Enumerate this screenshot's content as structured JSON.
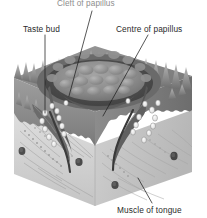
{
  "figure": {
    "type": "anatomical-cutaway-diagram",
    "palette": {
      "background": "#ffffff",
      "label_text": "#2b2b2b",
      "faded_label_text": "#8d8d8d",
      "leader_line": "#1f1f1f",
      "epithelium_dark": "#6e6e6e",
      "epithelium_mid": "#8a8a8a",
      "epithelium_light": "#a8a8a8",
      "papilla_crown": "#7c7c7c",
      "trench_shadow": "#4a4a4a",
      "muscle_front_face": "#d4d4d4",
      "muscle_right_face": "#c2c2c2",
      "muscle_fibre_line": "#9a9a9a",
      "muscle_fibre_spot": "#4e4e4e",
      "taste_bud_fill": "#f2f2f2",
      "taste_bud_stroke": "#7a7a7a"
    },
    "labels": [
      {
        "id": "cleft",
        "text": "Cleft of papillus",
        "note": "clipped at top edge of image, rendered faded",
        "x": 57,
        "y": -1,
        "leader": {
          "from": [
            92,
            11
          ],
          "to": [
            69,
            96
          ]
        }
      },
      {
        "id": "taste-bud",
        "text": "Taste bud",
        "x": 23,
        "y": 24,
        "leader": {
          "from": [
            45,
            35
          ],
          "to": [
            45,
            113
          ]
        }
      },
      {
        "id": "centre",
        "text": "Centre of papillus",
        "x": 116,
        "y": 24,
        "leader": {
          "from": [
            148,
            35
          ],
          "to": [
            103,
            116
          ]
        }
      },
      {
        "id": "muscle",
        "text": "Muscle of tongue",
        "x": 117,
        "y": 205,
        "leader": {
          "from": [
            152,
            203
          ],
          "to": [
            138,
            178
          ]
        }
      }
    ],
    "structures": [
      {
        "name": "epithelial surface spikes",
        "count": 26
      },
      {
        "name": "circular trench (vallum)",
        "count": 1
      },
      {
        "name": "taste buds lining trench",
        "count": 22
      },
      {
        "name": "muscle fibre cross-sections",
        "count": 5
      }
    ]
  }
}
